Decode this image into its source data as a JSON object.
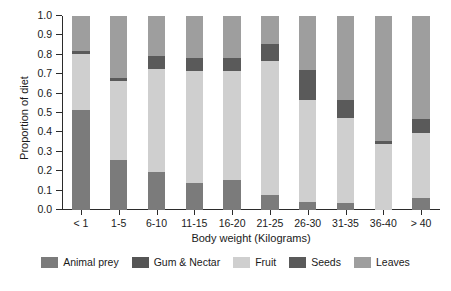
{
  "chart_data": {
    "type": "bar",
    "subtype": "stacked-bar-100-percent",
    "title": "",
    "xlabel": "Body weight (Kilograms)",
    "ylabel": "Proportion of diet",
    "ylim": [
      0.0,
      1.0
    ],
    "yticks": [
      "1.0",
      "0.9",
      "0.8",
      "0.7",
      "0.6",
      "0.5",
      "0.4",
      "0.3",
      "0.2",
      "0.1",
      "0.0"
    ],
    "ytick_values": [
      1.0,
      0.9,
      0.8,
      0.7,
      0.6,
      0.5,
      0.4,
      0.3,
      0.2,
      0.1,
      0.0
    ],
    "grid": false,
    "legend_position": "bottom",
    "categories": [
      "< 1",
      "1-5",
      "6-10",
      "11-15",
      "16-20",
      "21-25",
      "26-30",
      "31-35",
      "36-40",
      "> 40"
    ],
    "series": [
      {
        "name": "Animal prey",
        "color": "#7b7b7b",
        "values": [
          0.515,
          0.26,
          0.195,
          0.14,
          0.155,
          0.075,
          0.04,
          0.035,
          0.0,
          0.06
        ]
      },
      {
        "name": "Gum & Nectar",
        "color": "#555555",
        "values": [
          0.0,
          0.0,
          0.0,
          0.0,
          0.0,
          0.0,
          0.0,
          0.0,
          0.0,
          0.0
        ]
      },
      {
        "name": "Fruit",
        "color": "#cfcfcf",
        "values": [
          0.29,
          0.405,
          0.53,
          0.575,
          0.56,
          0.695,
          0.525,
          0.44,
          0.34,
          0.335
        ]
      },
      {
        "name": "Seeds",
        "color": "#5a5a5a",
        "values": [
          0.015,
          0.015,
          0.07,
          0.07,
          0.07,
          0.085,
          0.155,
          0.09,
          0.015,
          0.075
        ]
      },
      {
        "name": "Leaves",
        "color": "#9e9e9e",
        "values": [
          0.18,
          0.32,
          0.205,
          0.215,
          0.215,
          0.145,
          0.28,
          0.435,
          0.645,
          0.53
        ]
      }
    ]
  },
  "legend": {
    "items": [
      {
        "label": "Animal prey",
        "color": "#7b7b7b"
      },
      {
        "label": "Gum & Nectar",
        "color": "#555555"
      },
      {
        "label": "Fruit",
        "color": "#cfcfcf"
      },
      {
        "label": "Seeds",
        "color": "#5a5a5a"
      },
      {
        "label": "Leaves",
        "color": "#9e9e9e"
      }
    ]
  }
}
